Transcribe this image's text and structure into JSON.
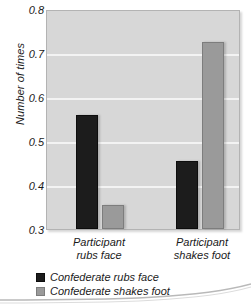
{
  "chart_data": {
    "type": "bar",
    "title": "",
    "xlabel": "",
    "ylabel": "Number of times",
    "ylim": [
      0.3,
      0.8
    ],
    "yticks": [
      "0.8",
      "0.7",
      "0.6",
      "0.5",
      "0.4",
      "0.3"
    ],
    "ytick_values": [
      0.8,
      0.7,
      0.6,
      0.5,
      0.4,
      0.3
    ],
    "grid": true,
    "legend_position": "bottom-left",
    "categories": [
      "Participant rubs face",
      "Participant shakes foot"
    ],
    "category_lines": [
      [
        "Participant",
        "rubs face"
      ],
      [
        "Participant",
        "shakes foot"
      ]
    ],
    "series": [
      {
        "name": "Confederate rubs face",
        "color": "#1c1c1c",
        "values": [
          0.56,
          0.455
        ]
      },
      {
        "name": "Confederate shakes foot",
        "color": "#9a9a9a",
        "values": [
          0.355,
          0.725
        ]
      }
    ]
  },
  "legend": {
    "items": [
      {
        "label": "Confederate rubs face",
        "swatch": "dark"
      },
      {
        "label": "Confederate shakes foot",
        "swatch": "light"
      }
    ]
  },
  "colors": {
    "plot_background": "#d7d7d7",
    "gridline": "#f3f3f3",
    "dark_bar": "#1c1c1c",
    "light_bar": "#9a9a9a",
    "text": "#1a1a1a"
  }
}
